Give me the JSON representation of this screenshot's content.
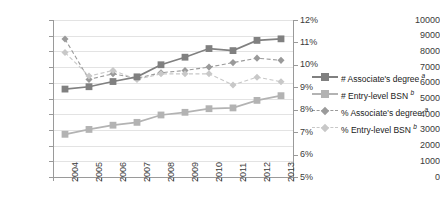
{
  "chart_data": {
    "type": "line",
    "title": "",
    "xlabel": "",
    "ylabel": "",
    "grid": true,
    "legend_position": "right",
    "categories": [
      "2004",
      "2005",
      "2006",
      "2007",
      "2008",
      "2009",
      "2010",
      "2011",
      "2012",
      "2013"
    ],
    "axes": {
      "left": {
        "ylabel": "",
        "ylim": [
          0,
          10000
        ],
        "step": 1000,
        "ticks": [
          "0",
          "1000",
          "2000",
          "3000",
          "4000",
          "5000",
          "6000",
          "7000",
          "8000",
          "9000",
          "10000"
        ]
      },
      "right": {
        "ylabel": "",
        "ylim": [
          5,
          12
        ],
        "step": 1,
        "ticks": [
          "5%",
          "6%",
          "7%",
          "8%",
          "9%",
          "10%",
          "11%",
          "12%"
        ]
      }
    },
    "series": [
      {
        "name": "# Associate's degree",
        "note": "a",
        "axis": "left",
        "style": "solid",
        "marker": "square",
        "color": "#808080",
        "values": [
          5600,
          5750,
          6080,
          6380,
          7150,
          7630,
          8180,
          8050,
          8700,
          8800
        ]
      },
      {
        "name": "# Entry-level BSN",
        "note": "b",
        "axis": "left",
        "style": "solid",
        "marker": "square",
        "color": "#b3b3b3",
        "values": [
          2720,
          3030,
          3300,
          3480,
          3950,
          4120,
          4350,
          4400,
          4880,
          5180
        ]
      },
      {
        "name": "% Associate's degree",
        "note": "a",
        "axis": "right",
        "style": "dashed",
        "marker": "diamond",
        "color": "#9a9a9a",
        "values": [
          11.15,
          9.35,
          9.6,
          9.4,
          9.65,
          9.75,
          9.9,
          10.1,
          10.3,
          10.2
        ]
      },
      {
        "name": "% Entry-level BSN",
        "note": "b",
        "axis": "right",
        "style": "dashed",
        "marker": "diamond",
        "color": "#c8c8c8",
        "values": [
          10.55,
          9.5,
          9.75,
          9.35,
          9.6,
          9.6,
          9.6,
          9.1,
          9.45,
          9.25
        ]
      }
    ]
  },
  "legend": {
    "items": [
      {
        "label": "# Associate's degree",
        "note": "a"
      },
      {
        "label": "# Entry-level BSN",
        "note": "b"
      },
      {
        "label": "% Associate's degree",
        "note": "a"
      },
      {
        "label": "% Entry-level BSN",
        "note": "b"
      }
    ]
  }
}
